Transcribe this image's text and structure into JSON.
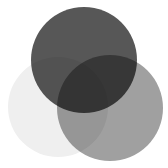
{
  "diagram": {
    "type": "venn",
    "sets": [
      {
        "id": "top",
        "label": "",
        "cx": 84,
        "cy": 60,
        "r": 53,
        "fill": "#575757"
      },
      {
        "id": "left",
        "label": "",
        "cx": 58,
        "cy": 107,
        "r": 50,
        "fill": "#efefef"
      },
      {
        "id": "right",
        "label": "",
        "cx": 110,
        "cy": 108,
        "r": 53,
        "fill": "#a0a0a0"
      }
    ],
    "background": "#ffffff"
  }
}
